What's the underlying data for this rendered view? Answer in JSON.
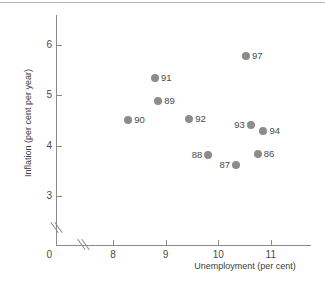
{
  "chart_data": {
    "type": "scatter",
    "title": "",
    "xlabel": "Unemployment (per cent)",
    "ylabel": "Inflation (per cent per year)",
    "xlim": [
      7.5,
      11.5
    ],
    "ylim": [
      2.6,
      6.4
    ],
    "xticks": [
      8,
      9,
      10,
      11
    ],
    "yticks": [
      3,
      4,
      5,
      6
    ],
    "xtick_labels": [
      "8",
      "9",
      "10",
      "11"
    ],
    "ytick_labels": [
      "3",
      "4",
      "5",
      "6"
    ],
    "origin_label": "0",
    "axis_break_x": true,
    "axis_break_y": true,
    "grid": false,
    "legend": false,
    "marker_color": "#8c8c8c",
    "axis_color": "#8a8a8a",
    "points": [
      {
        "label": "86",
        "x": 10.75,
        "y": 3.83,
        "label_pos": "right"
      },
      {
        "label": "87",
        "x": 10.34,
        "y": 3.61,
        "label_pos": "left"
      },
      {
        "label": "88",
        "x": 9.81,
        "y": 3.81,
        "label_pos": "left"
      },
      {
        "label": "89",
        "x": 8.86,
        "y": 4.89,
        "label_pos": "right"
      },
      {
        "label": "90",
        "x": 8.29,
        "y": 4.51,
        "label_pos": "right"
      },
      {
        "label": "91",
        "x": 8.8,
        "y": 5.34,
        "label_pos": "right"
      },
      {
        "label": "92",
        "x": 9.45,
        "y": 4.52,
        "label_pos": "right"
      },
      {
        "label": "93",
        "x": 10.62,
        "y": 4.41,
        "label_pos": "left"
      },
      {
        "label": "94",
        "x": 10.86,
        "y": 4.3,
        "label_pos": "right"
      },
      {
        "label": "97",
        "x": 10.53,
        "y": 5.79,
        "label_pos": "right"
      }
    ]
  }
}
